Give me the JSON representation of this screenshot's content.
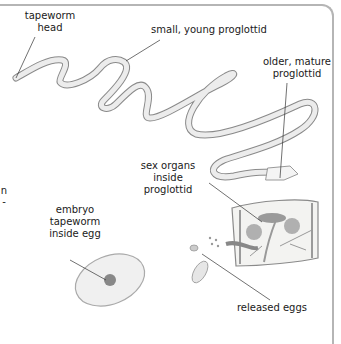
{
  "diagram": {
    "labels": {
      "head": "tapeworm\nhead",
      "young": "small, young proglottid",
      "mature": "older, mature\nproglottid",
      "sex_organs": "sex organs\ninside\nproglottid",
      "embryo": "embryo\ntapeworm\ninside egg",
      "eggs": "released eggs",
      "left_cut_1": "n",
      "left_cut_2": "-"
    },
    "colors": {
      "frame": "#b5b5b5",
      "worm_fill": "#ececec",
      "worm_stroke": "#8a8a8a",
      "leader": "#333333",
      "text": "#1a1a1a"
    }
  }
}
